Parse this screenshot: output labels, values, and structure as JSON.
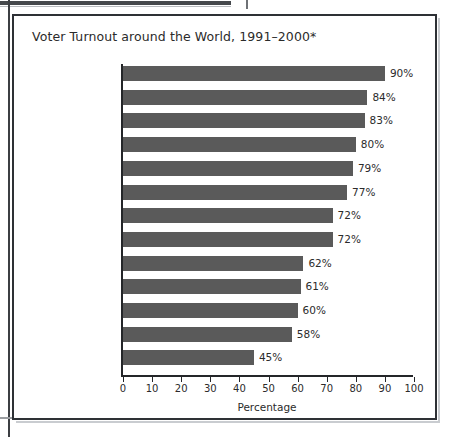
{
  "figure": {
    "title": "Voter Turnout around the World, 1991–2000*"
  },
  "chart_data": {
    "type": "bar",
    "orientation": "horizontal",
    "title": "Voter Turnout around the World, 1991–2000*",
    "xlabel": "Percentage",
    "ylabel": "",
    "xlim": [
      0,
      100
    ],
    "grid": false,
    "legend": null,
    "categories": [
      "Italy",
      "Sweden",
      "Australia",
      "Turkey",
      "Spain",
      "Brazil",
      "Germany",
      "United Kingdom",
      "Thailand",
      "France",
      "Canada",
      "Mexico",
      "United States"
    ],
    "values": [
      90,
      84,
      83,
      80,
      79,
      77,
      72,
      72,
      62,
      61,
      60,
      58,
      45
    ],
    "value_labels": [
      "90%",
      "84%",
      "83%",
      "80%",
      "79%",
      "77%",
      "72%",
      "72%",
      "62%",
      "61%",
      "60%",
      "58%",
      "45%"
    ],
    "xticks": [
      0,
      10,
      20,
      30,
      40,
      50,
      60,
      70,
      80,
      90,
      100
    ],
    "xtick_labels": [
      "0",
      "10",
      "20",
      "30",
      "40",
      "50",
      "60",
      "70",
      "80",
      "90",
      "100"
    ],
    "bar_color": "#5a5a5a",
    "axis_color": "#242629",
    "text_color": "#2b2b2b"
  }
}
